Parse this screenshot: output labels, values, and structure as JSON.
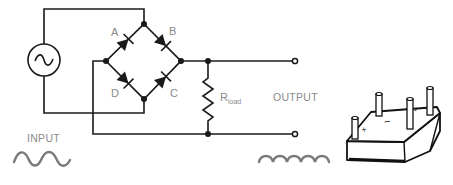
{
  "diagram": {
    "labels": {
      "diode_a": "A",
      "diode_b": "B",
      "diode_c": "C",
      "diode_d": "D",
      "resistor_main": "R",
      "resistor_sub": "load",
      "input": "INPUT",
      "output": "OUTPUT"
    },
    "package_markings": {
      "pin_ac1": "~",
      "pin_neg": "-",
      "pin_pos": "+"
    },
    "colors": {
      "wire": "#1a1a1a",
      "label": "#8a8a8a",
      "waveform": "#7a7a7a"
    },
    "components": [
      {
        "id": "ac-source",
        "type": "AC voltage source",
        "symbol": "~"
      },
      {
        "id": "diode-a",
        "type": "diode",
        "label": "A"
      },
      {
        "id": "diode-b",
        "type": "diode",
        "label": "B"
      },
      {
        "id": "diode-c",
        "type": "diode",
        "label": "C"
      },
      {
        "id": "diode-d",
        "type": "diode",
        "label": "D"
      },
      {
        "id": "load-resistor",
        "type": "resistor",
        "label": "R_load"
      },
      {
        "id": "bridge-package",
        "type": "bridge rectifier package",
        "pins": 4
      }
    ]
  }
}
